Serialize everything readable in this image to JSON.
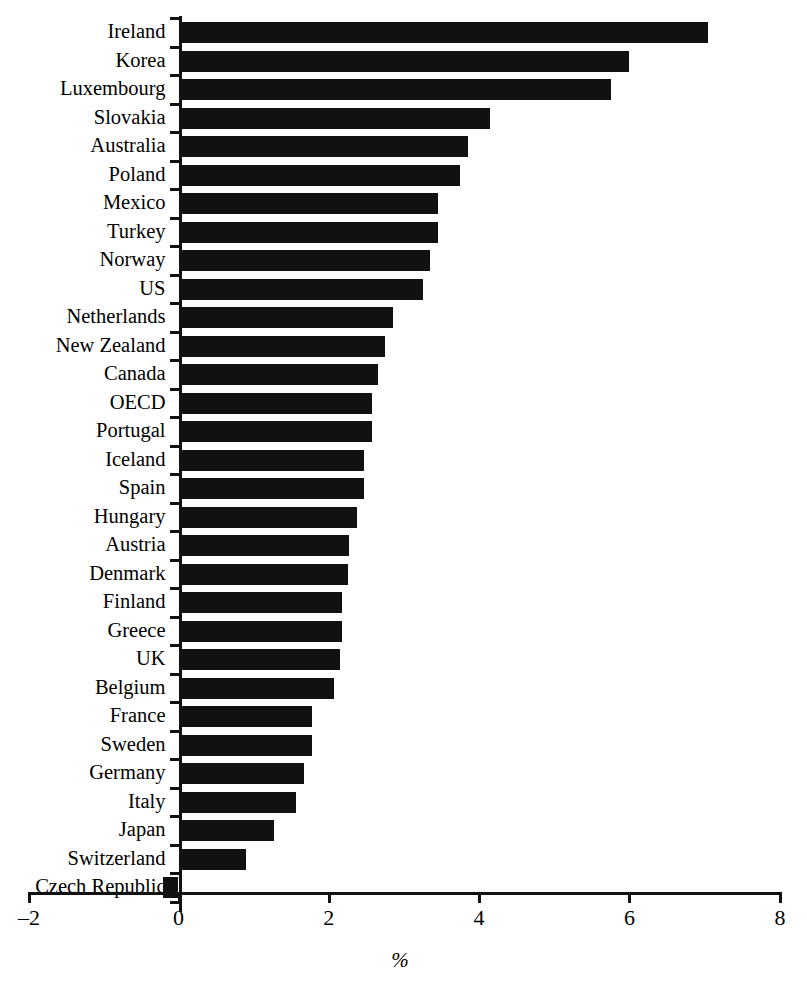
{
  "chart_data": {
    "type": "bar",
    "orientation": "horizontal",
    "title": "",
    "subtitle": "",
    "xlabel": "%",
    "ylabel": "",
    "xlim": [
      -2,
      8
    ],
    "xticks": [
      -2,
      0,
      2,
      4,
      6,
      8
    ],
    "xtick_labels": [
      "–2",
      "0",
      "2",
      "4",
      "6",
      "8"
    ],
    "grid": false,
    "legend": null,
    "bar_color": "#111111",
    "categories": [
      "Ireland",
      "Korea",
      "Luxembourg",
      "Slovakia",
      "Australia",
      "Poland",
      "Mexico",
      "Turkey",
      "Norway",
      "US",
      "Netherlands",
      "New Zealand",
      "Canada",
      "OECD",
      "Portugal",
      "Iceland",
      "Spain",
      "Hungary",
      "Austria",
      "Denmark",
      "Finland",
      "Greece",
      "UK",
      "Belgium",
      "France",
      "Sweden",
      "Germany",
      "Italy",
      "Japan",
      "Switzerland",
      "Czech Republic"
    ],
    "values": [
      7.05,
      6.0,
      5.75,
      4.15,
      3.85,
      3.75,
      3.45,
      3.45,
      3.35,
      3.25,
      2.85,
      2.75,
      2.65,
      2.58,
      2.58,
      2.47,
      2.47,
      2.37,
      2.27,
      2.25,
      2.17,
      2.17,
      2.15,
      2.07,
      1.77,
      1.77,
      1.67,
      1.57,
      1.27,
      0.9,
      -0.2
    ]
  }
}
